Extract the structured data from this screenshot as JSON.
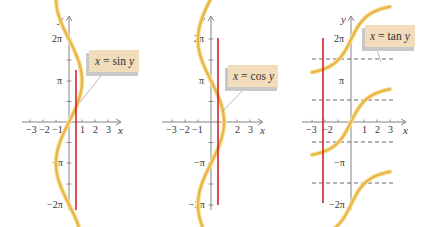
{
  "figure": {
    "colors": {
      "curve": "#e8b640",
      "curve_glow": "#f6dfa0",
      "red_line": "#d2232a",
      "axis": "#666666",
      "label_bg": "#f1dcbc",
      "label_shadow": "#b9b9b9",
      "dash": "#555555"
    }
  },
  "chart_data": [
    {
      "type": "line",
      "panel": "left",
      "title": "x = sin y",
      "xlabel": "x",
      "ylabel": "y",
      "x_ticks": [
        -3,
        -2,
        -1,
        1,
        2,
        3
      ],
      "x_tick_labels": [
        "-3",
        "-2",
        "-1",
        "1",
        "2",
        "3"
      ],
      "y_ticks_labeled": [
        "2π",
        "π",
        "-π",
        "-2π"
      ],
      "y_ticks": [
        "-2π",
        "-3π/2",
        "-π",
        "-π/2",
        "π/2",
        "π",
        "3π/2",
        "2π"
      ],
      "xlim": [
        -3.5,
        3.5
      ],
      "ylim": [
        -6.283,
        6.283
      ],
      "curve": {
        "equation": "x = sin(y)",
        "y_range": [
          -6.283,
          6.283
        ]
      },
      "vertical_line": {
        "x": 0.5,
        "y_range": [
          -6.283,
          3.35
        ],
        "label": "horizontal line test"
      },
      "annotation": {
        "text": "x = sin y"
      }
    },
    {
      "type": "line",
      "panel": "middle",
      "title": "x = cos y",
      "xlabel": "x",
      "ylabel": "y",
      "x_ticks": [
        -3,
        -2,
        -1,
        1,
        2,
        3
      ],
      "x_tick_labels": [
        "-3",
        "-2",
        "-1",
        "",
        "2",
        "3"
      ],
      "y_ticks_labeled": [
        "2π",
        "π",
        "-π",
        "-2π"
      ],
      "y_ticks": [
        "-2π",
        "-3π/2",
        "-π",
        "-π/2",
        "π/2",
        "π",
        "3π/2",
        "2π"
      ],
      "xlim": [
        -3.5,
        3.5
      ],
      "ylim": [
        -6.283,
        6.283
      ],
      "curve": {
        "equation": "x = cos(y)",
        "y_range": [
          -6.283,
          6.283
        ]
      },
      "vertical_line": {
        "x": 0.5,
        "y_range": [
          -6.283,
          6.283
        ]
      },
      "annotation": {
        "text": "x = cos y"
      }
    },
    {
      "type": "line",
      "panel": "right",
      "title": "x = tan y",
      "xlabel": "x",
      "ylabel": "y",
      "x_ticks": [
        -3,
        -2,
        -1,
        1,
        2,
        3
      ],
      "x_tick_labels": [
        "-3",
        "-2",
        "",
        "1",
        "2",
        "3"
      ],
      "y_ticks_labeled": [
        "2π",
        "π",
        "-π",
        "-2π"
      ],
      "xlim": [
        -3.5,
        3.5
      ],
      "ylim": [
        -6.283,
        6.283
      ],
      "curve": {
        "equation": "x = tan(y)",
        "x_clip": [
          -3,
          3
        ]
      },
      "asymptotes_y": [
        "3π/2",
        "π/2",
        "-π/2",
        "-3π/2"
      ],
      "vertical_line": {
        "x": -2,
        "y_range": [
          -6.0,
          6.4
        ]
      },
      "annotation": {
        "text": "x = tan y"
      }
    }
  ],
  "labels": {
    "sin": {
      "eq_x": "x",
      "eq_eq": "=",
      "eq_fn": "sin",
      "eq_y": "y"
    },
    "cos": {
      "eq_x": "x",
      "eq_eq": "=",
      "eq_fn": "cos",
      "eq_y": "y"
    },
    "tan": {
      "eq_x": "x",
      "eq_eq": "=",
      "eq_fn": "tan",
      "eq_y": "y"
    },
    "axis_x": "x",
    "axis_y": "y",
    "y_2pi": "2π",
    "y_pi": "π",
    "y_mpi": "−π",
    "y_m2pi": "−2π",
    "xt": [
      "−3",
      "−2",
      "−1",
      "1",
      "2",
      "3"
    ]
  }
}
